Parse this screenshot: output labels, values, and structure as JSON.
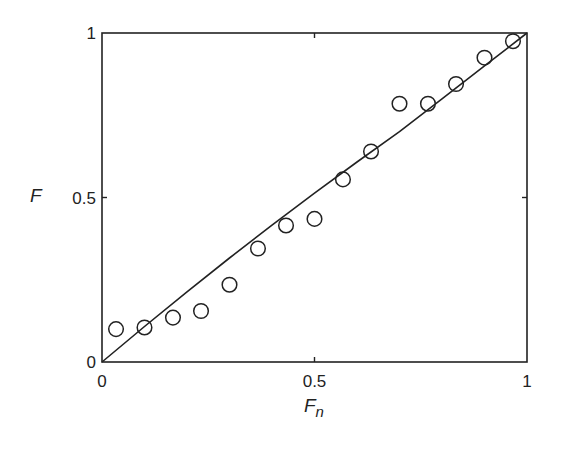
{
  "chart_data": {
    "type": "scatter",
    "title": "",
    "xlabel": "F",
    "xlabel_subscript": "n",
    "ylabel": "F",
    "xlim": [
      0,
      1
    ],
    "ylim": [
      0,
      1
    ],
    "grid": false,
    "legend": null,
    "x_ticks": [
      {
        "value": 0,
        "label": "0"
      },
      {
        "value": 0.5,
        "label": "0.5"
      },
      {
        "value": 1,
        "label": "1"
      }
    ],
    "y_ticks": [
      {
        "value": 0,
        "label": "0"
      },
      {
        "value": 0.5,
        "label": "0.5"
      },
      {
        "value": 1,
        "label": "1"
      }
    ],
    "series": [
      {
        "name": "observed",
        "kind": "markers",
        "marker": "open-circle",
        "x": [
          0.033,
          0.1,
          0.167,
          0.233,
          0.3,
          0.367,
          0.433,
          0.5,
          0.567,
          0.633,
          0.7,
          0.767,
          0.833,
          0.9,
          0.967
        ],
        "y": [
          0.1,
          0.105,
          0.135,
          0.155,
          0.235,
          0.345,
          0.415,
          0.435,
          0.555,
          0.64,
          0.785,
          0.785,
          0.845,
          0.925,
          0.975
        ]
      },
      {
        "name": "fitted",
        "kind": "line",
        "x": [
          0,
          0.1,
          0.2,
          0.3,
          0.4,
          0.5,
          0.6,
          0.7,
          0.8,
          0.9,
          1.0
        ],
        "y": [
          0,
          0.108,
          0.213,
          0.316,
          0.416,
          0.513,
          0.608,
          0.7,
          0.8,
          0.9,
          1.0
        ]
      }
    ]
  },
  "colors": {
    "ink": "#222222",
    "background": "#ffffff"
  }
}
